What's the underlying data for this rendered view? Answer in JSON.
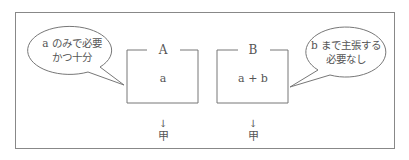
{
  "diagram": {
    "boxes": [
      {
        "title": "A",
        "content": "a",
        "result_arrow": "↓",
        "result": "甲"
      },
      {
        "title": "B",
        "content": "a + b",
        "result_arrow": "↓",
        "result": "甲"
      }
    ],
    "bubbles": [
      {
        "line1": "a のみで必要",
        "line2": "かつ十分",
        "points_to": "A"
      },
      {
        "line1": "b まで主張する",
        "line2": "必要なし",
        "points_to": "B"
      }
    ],
    "colors": {
      "stroke": "#888888",
      "text": "#555555",
      "background": "#ffffff"
    }
  }
}
